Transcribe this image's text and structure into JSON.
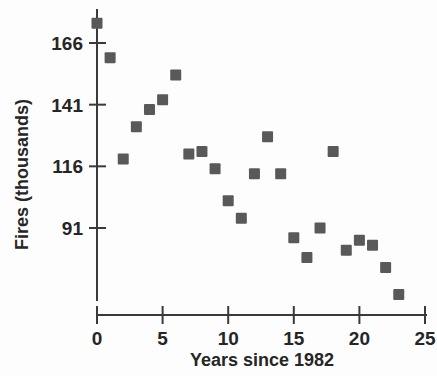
{
  "chart_data": {
    "type": "scatter",
    "title": "",
    "xlabel": "Years since 1982",
    "ylabel": "Fires (thousands)",
    "xlim": [
      -0.6,
      25.4
    ],
    "ylim": [
      57,
      178
    ],
    "grid": false,
    "legend": null,
    "xticks": [
      0,
      5,
      10,
      15,
      20,
      25
    ],
    "xtick_labels": [
      "0",
      "5",
      "10",
      "15",
      "20",
      "25"
    ],
    "yticks": [
      91,
      116,
      141,
      166
    ],
    "ytick_labels": [
      "91",
      "116",
      "141",
      "166"
    ],
    "marker_color": "#595959",
    "marker_shape": "square",
    "x": [
      0,
      1,
      2,
      3,
      4,
      5,
      6,
      7,
      8,
      9,
      10,
      11,
      12,
      13,
      14,
      15,
      16,
      17,
      18,
      19,
      20,
      21,
      22,
      23
    ],
    "y": [
      174,
      160,
      119,
      132,
      139,
      143,
      153,
      121,
      122,
      115,
      102,
      95,
      113,
      128,
      113,
      87,
      79,
      91,
      122,
      82,
      86,
      84,
      75,
      64
    ],
    "points": [
      {
        "x": 0,
        "y": 174
      },
      {
        "x": 1,
        "y": 160
      },
      {
        "x": 2,
        "y": 119
      },
      {
        "x": 3,
        "y": 132
      },
      {
        "x": 4,
        "y": 139
      },
      {
        "x": 5,
        "y": 143
      },
      {
        "x": 6,
        "y": 153
      },
      {
        "x": 7,
        "y": 121
      },
      {
        "x": 8,
        "y": 122
      },
      {
        "x": 9,
        "y": 115
      },
      {
        "x": 10,
        "y": 102
      },
      {
        "x": 11,
        "y": 95
      },
      {
        "x": 12,
        "y": 113
      },
      {
        "x": 13,
        "y": 128
      },
      {
        "x": 14,
        "y": 113
      },
      {
        "x": 15,
        "y": 87
      },
      {
        "x": 16,
        "y": 79
      },
      {
        "x": 17,
        "y": 91
      },
      {
        "x": 18,
        "y": 122
      },
      {
        "x": 19,
        "y": 82
      },
      {
        "x": 20,
        "y": 86
      },
      {
        "x": 21,
        "y": 84
      },
      {
        "x": 22,
        "y": 75
      },
      {
        "x": 23,
        "y": 64
      }
    ]
  },
  "axes": {
    "x_title": "Years since 1982",
    "y_title": "Fires (thousands)",
    "x_tick_labels": [
      "0",
      "5",
      "10",
      "15",
      "20",
      "25"
    ],
    "y_tick_labels": [
      "91",
      "116",
      "141",
      "166"
    ]
  }
}
